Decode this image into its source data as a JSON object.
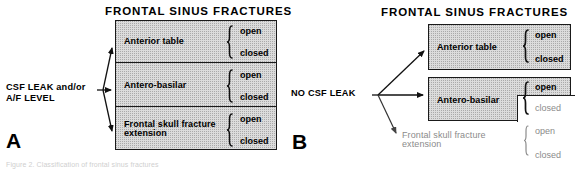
{
  "figure": {
    "caption_fragment": "Figure 2. Classification of frontal sinus fractures"
  },
  "panels": [
    {
      "letter": "A",
      "title": "FRONTAL SINUS FRACTURES",
      "condition": {
        "line1": "CSF LEAK and/or",
        "line2": "A/F LEVEL"
      },
      "rows": [
        {
          "label": "Anterior table",
          "label_line2": "",
          "shaded": true,
          "outcomes": [
            {
              "text": "open",
              "shaded": true
            },
            {
              "text": "closed",
              "shaded": true
            }
          ]
        },
        {
          "label": "Antero-basilar",
          "label_line2": "",
          "shaded": true,
          "outcomes": [
            {
              "text": "open",
              "shaded": true
            },
            {
              "text": "closed",
              "shaded": true
            }
          ]
        },
        {
          "label": "Frontal skull fracture",
          "label_line2": "extension",
          "shaded": true,
          "outcomes": [
            {
              "text": "open",
              "shaded": true
            },
            {
              "text": "closed",
              "shaded": true
            }
          ]
        }
      ]
    },
    {
      "letter": "B",
      "title": "FRONTAL  SINUS  FRACTURES",
      "condition": {
        "line1": "NO CSF  LEAK",
        "line2": ""
      },
      "rows": [
        {
          "label": "Anterior table",
          "label_line2": "",
          "shaded": true,
          "outcomes": [
            {
              "text": "open",
              "shaded": true
            },
            {
              "text": "closed",
              "shaded": true
            }
          ]
        },
        {
          "label": "Antero-basilar",
          "label_line2": "",
          "shaded": true,
          "outcomes": [
            {
              "text": "open",
              "shaded": true
            },
            {
              "text": "closed",
              "shaded": false
            }
          ]
        },
        {
          "label": "Frontal skull fracture",
          "label_line2": "extension",
          "shaded": false,
          "outcomes": [
            {
              "text": "open",
              "shaded": false
            },
            {
              "text": "closed",
              "shaded": false
            }
          ]
        }
      ]
    }
  ],
  "colors": {
    "shade_fill": "#dcdcdc",
    "stroke": "#1a1a1a",
    "muted_text": "#8b8b8b"
  }
}
